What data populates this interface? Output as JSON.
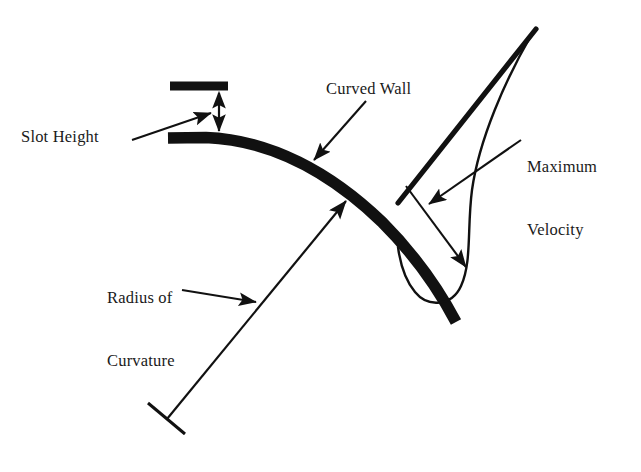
{
  "figure": {
    "type": "technical-line-diagram",
    "background_color": "#ffffff",
    "ink_color": "#111111"
  },
  "labels": {
    "slot_height": "Slot Height",
    "curved_wall": "Curved Wall",
    "maximum_velocity_line1": "Maximum",
    "maximum_velocity_line2": "Velocity",
    "radius_line1": "Radius of",
    "radius_line2": "Curvature"
  },
  "geometry": {
    "slot_lip_bar": {
      "x1": 170,
      "y1": 86,
      "x2": 228,
      "y2": 86,
      "thickness": 9
    },
    "curved_wall": {
      "start": [
        168,
        138
      ],
      "end": [
        455,
        325
      ],
      "thickness": 11
    },
    "slot_height_arrow": {
      "x": 219,
      "y_top": 92,
      "y_bottom": 133,
      "double_headed": true
    },
    "radius_line": {
      "from": [
        165,
        420
      ],
      "to": [
        345,
        202
      ],
      "tick_at_center": true,
      "arrow_at_wall": true
    },
    "jet_boundary_line": {
      "from": [
        535,
        30
      ],
      "to": [
        400,
        200
      ],
      "thickness": 5
    },
    "velocity_profile_curve": {
      "apex": [
        532,
        33
      ],
      "bulge_max_x": 480,
      "bottom": [
        455,
        300
      ]
    },
    "max_velocity_leader": {
      "from": [
        520,
        140
      ],
      "arrow_1_to": [
        430,
        205
      ],
      "arrow_2_to": [
        467,
        268
      ]
    },
    "slot_height_leader": {
      "from": [
        133,
        140
      ],
      "to": [
        212,
        114
      ]
    },
    "curved_wall_leader": {
      "from": [
        365,
        100
      ],
      "to": [
        315,
        160
      ]
    },
    "radius_leader": {
      "from": [
        185,
        290
      ],
      "to": [
        255,
        302
      ]
    }
  }
}
